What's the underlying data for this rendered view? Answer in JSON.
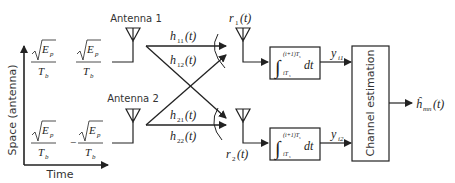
{
  "axes": {
    "y_label": "Space (antenna)",
    "x_label": "Time"
  },
  "pilot_symbols": {
    "antenna1": [
      {
        "sign": "",
        "numerator_root": "E",
        "numerator_sub": "p",
        "denominator": "T",
        "denominator_sub": "b"
      },
      {
        "sign": "",
        "numerator_root": "E",
        "numerator_sub": "p",
        "denominator": "T",
        "denominator_sub": "b"
      }
    ],
    "antenna2": [
      {
        "sign": "",
        "numerator_root": "E",
        "numerator_sub": "p",
        "denominator": "T",
        "denominator_sub": "b"
      },
      {
        "sign": "−",
        "numerator_root": "E",
        "numerator_sub": "p",
        "denominator": "T",
        "denominator_sub": "b"
      }
    ]
  },
  "transmitters": [
    {
      "label": "Antenna 1"
    },
    {
      "label": "Antenna 2"
    }
  ],
  "channels": [
    {
      "base": "h",
      "sub": "11",
      "arg": "(t)"
    },
    {
      "base": "h",
      "sub": "12",
      "arg": "(t)"
    },
    {
      "base": "h",
      "sub": "21",
      "arg": "(t)"
    },
    {
      "base": "h",
      "sub": "22",
      "arg": "(t)"
    }
  ],
  "receivers": [
    {
      "base": "r",
      "sub": "1",
      "arg": "(t)"
    },
    {
      "base": "r",
      "sub": "2",
      "arg": "(t)"
    }
  ],
  "integrators": [
    {
      "upper": "(i+1)T",
      "upper_sub": "s",
      "lower": "iT",
      "lower_sub": "s",
      "diff": "dt"
    },
    {
      "upper": "(i+1)T",
      "upper_sub": "s",
      "lower": "iT",
      "lower_sub": "s",
      "diff": "dt"
    }
  ],
  "outputs": [
    {
      "base": "y",
      "sub": "i1"
    },
    {
      "base": "y",
      "sub": "i2"
    }
  ],
  "estimator": {
    "label": "Channel estimation",
    "output": {
      "base": "ĥ",
      "sub": "mn",
      "arg": "(t)"
    }
  }
}
